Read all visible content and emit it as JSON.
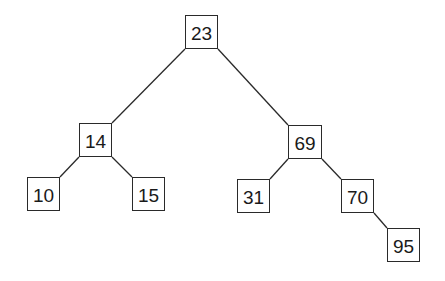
{
  "diagram": {
    "type": "binary-search-tree",
    "colors": {
      "line": "#2a2a2a",
      "text": "#1a1a1a",
      "background": "#ffffff"
    },
    "nodes": [
      {
        "id": "n23",
        "label": "23",
        "x": 185,
        "y": 15,
        "w": 33,
        "h": 34
      },
      {
        "id": "n14",
        "label": "14",
        "x": 79,
        "y": 123,
        "w": 33,
        "h": 34
      },
      {
        "id": "n69",
        "label": "69",
        "x": 288,
        "y": 125,
        "w": 34,
        "h": 34
      },
      {
        "id": "n10",
        "label": "10",
        "x": 27,
        "y": 177,
        "w": 33,
        "h": 34
      },
      {
        "id": "n15",
        "label": "15",
        "x": 132,
        "y": 177,
        "w": 33,
        "h": 34
      },
      {
        "id": "n31",
        "label": "31",
        "x": 237,
        "y": 179,
        "w": 33,
        "h": 34
      },
      {
        "id": "n70",
        "label": "70",
        "x": 341,
        "y": 179,
        "w": 33,
        "h": 34
      },
      {
        "id": "n95",
        "label": "95",
        "x": 387,
        "y": 228,
        "w": 33,
        "h": 34
      }
    ],
    "edges": [
      {
        "from": "n23",
        "to": "n14",
        "x1": 185,
        "y1": 49,
        "x2": 112,
        "y2": 123
      },
      {
        "from": "n23",
        "to": "n69",
        "x1": 218,
        "y1": 49,
        "x2": 288,
        "y2": 125
      },
      {
        "from": "n14",
        "to": "n10",
        "x1": 79,
        "y1": 157,
        "x2": 60,
        "y2": 177
      },
      {
        "from": "n14",
        "to": "n15",
        "x1": 112,
        "y1": 157,
        "x2": 132,
        "y2": 177
      },
      {
        "from": "n69",
        "to": "n31",
        "x1": 288,
        "y1": 159,
        "x2": 270,
        "y2": 179
      },
      {
        "from": "n69",
        "to": "n70",
        "x1": 322,
        "y1": 159,
        "x2": 341,
        "y2": 179
      },
      {
        "from": "n70",
        "to": "n95",
        "x1": 374,
        "y1": 213,
        "x2": 387,
        "y2": 228
      }
    ]
  }
}
